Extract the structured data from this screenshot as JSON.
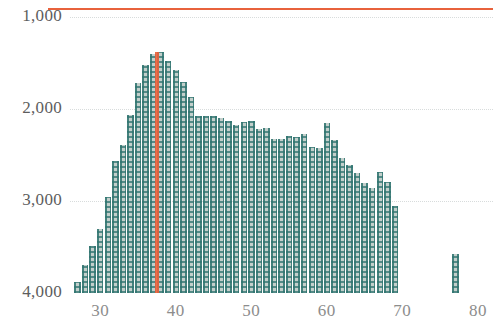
{
  "chart_data": {
    "type": "bar",
    "title": "",
    "subtitle": "",
    "xlabel": "",
    "ylabel": "",
    "x_tick_labels": [
      "30",
      "40",
      "50",
      "60",
      "70",
      "80"
    ],
    "x_ticks": [
      30,
      40,
      50,
      60,
      70,
      80
    ],
    "y_tick_labels": [
      "1,000",
      "2,000",
      "3,000",
      "4,000"
    ],
    "y_ticks": [
      1000,
      2000,
      3000,
      4000
    ],
    "xlim": [
      26,
      82
    ],
    "ylim": [
      4000,
      900
    ],
    "y_axis_inverted": true,
    "grid": true,
    "legend": false,
    "bar_fill_color": "#c3cfcb",
    "bar_pattern_color": "#2f7470",
    "axis_line_color": "#e8623c",
    "gridline_color": "#d8dcdc",
    "y_label_color": "#5d5d5d",
    "x_label_color": "#8d8d8d",
    "annotations": [
      {
        "name": "vertical-marker-line",
        "x": 37.5,
        "color": "#e8623c"
      }
    ],
    "categories": [
      27,
      28,
      29,
      30,
      31,
      32,
      33,
      34,
      35,
      36,
      37,
      38,
      39,
      40,
      41,
      42,
      43,
      44,
      45,
      46,
      47,
      48,
      49,
      50,
      51,
      52,
      53,
      54,
      55,
      56,
      57,
      58,
      59,
      60,
      61,
      62,
      63,
      64,
      65,
      66,
      67,
      68,
      69,
      77
    ],
    "values": [
      3880,
      3700,
      3490,
      3300,
      2960,
      2560,
      2390,
      2060,
      1720,
      1520,
      1400,
      1380,
      1480,
      1570,
      1700,
      1870,
      2080,
      2080,
      2070,
      2100,
      2130,
      2170,
      2140,
      2130,
      2220,
      2200,
      2330,
      2330,
      2290,
      2300,
      2270,
      2410,
      2420,
      2150,
      2340,
      2530,
      2610,
      2700,
      2800,
      2860,
      2680,
      2790,
      3050,
      3580
    ]
  }
}
